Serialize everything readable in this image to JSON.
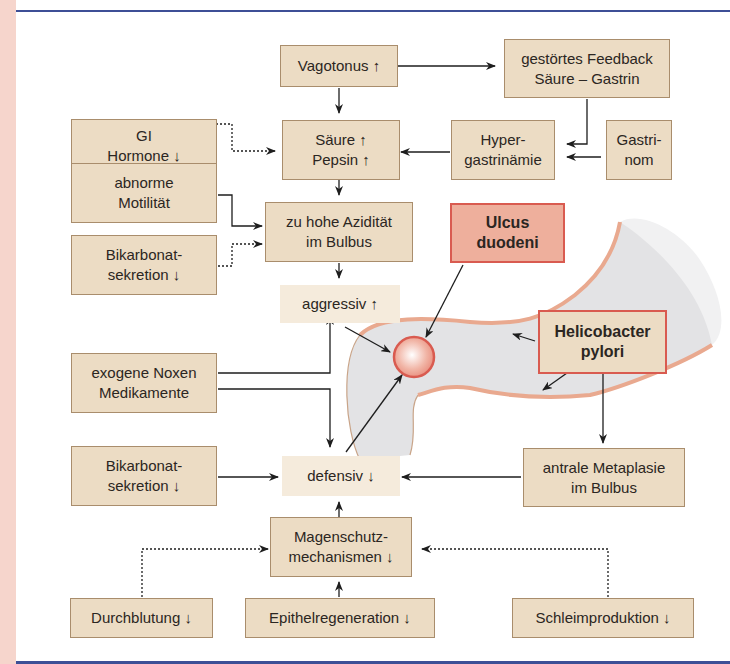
{
  "figure": {
    "colors": {
      "box_fill": "#ecdcc4",
      "box_border": "#a98d6c",
      "highlight_fill": "#eeaf9c",
      "highlight_border": "#d95b50",
      "rule": "#3d4f96",
      "side_band": "#f6d5cc",
      "duodenum_fill": "#e2e2e4",
      "duodenum_wall": "#e9a98f"
    },
    "nodes": {
      "vagotonus": "Vagotonus ↑",
      "feedback": "gestörtes Feedback\nSäure – Gastrin",
      "gi_hormone": "GI\nHormone ↓",
      "saeure_pepsin": "Säure ↑\nPepsin ↑",
      "hypergastrinaemie": "Hyper-\ngastrinämie",
      "gastrinom": "Gastri-\nnom",
      "motilitaet": "abnorme\nMotilität",
      "aziditaet": "zu hohe Azidität\nim Bulbus",
      "bikarbonat_top": "Bikarbonat-\nsekretion ↓",
      "ulcus": "Ulcus\nduodeni",
      "aggressiv": "aggressiv ↑",
      "helicobacter": "Helicobacter\npylori",
      "noxen": "exogene Noxen\nMedikamente",
      "bikarbonat_bottom": "Bikarbonat-\nsekretion ↓",
      "defensiv": "defensiv ↓",
      "metaplasie": "antrale Metaplasie\nim Bulbus",
      "magenschutz": "Magenschutz-\nmechanismen ↓",
      "durchblutung": "Durchblutung ↓",
      "epithel": "Epithelregeneration ↓",
      "schleim": "Schleimproduktion ↓"
    }
  }
}
